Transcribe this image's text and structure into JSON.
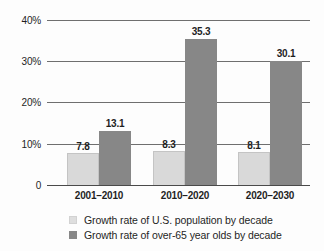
{
  "chart_data": {
    "type": "bar",
    "title": "",
    "subtitle": "",
    "xlabel": "",
    "ylabel": "",
    "ylim": [
      0,
      40
    ],
    "ytick_labels": [
      "40%",
      "30%",
      "20%",
      "10%",
      "0"
    ],
    "ytick_values": [
      40,
      30,
      20,
      10,
      0
    ],
    "grid": true,
    "legend_position": "bottom",
    "categories": [
      "2001–2010",
      "2010–2020",
      "2020–2030"
    ],
    "series": [
      {
        "name": "Growth rate of U.S. population by decade",
        "color": "#d9d9d9",
        "values": [
          7.8,
          8.3,
          8.1
        ],
        "labels": [
          "7.8",
          "8.3",
          "8.1"
        ]
      },
      {
        "name": "Growth rate of over-65 year olds by decade",
        "color": "#878787",
        "values": [
          13.1,
          35.3,
          30.1
        ],
        "labels": [
          "13.1",
          "35.3",
          "30.1"
        ]
      }
    ]
  },
  "axis": {
    "yticks": [
      {
        "label": "40%",
        "value": 40
      },
      {
        "label": "30%",
        "value": 30
      },
      {
        "label": "20%",
        "value": 20
      },
      {
        "label": "10%",
        "value": 10
      },
      {
        "label": "0",
        "value": 0
      }
    ]
  },
  "legend": {
    "items": [
      {
        "label": "Growth rate of U.S. population by decade",
        "swatch": "light"
      },
      {
        "label": "Growth rate of over-65 year olds by decade",
        "swatch": "dark"
      }
    ]
  }
}
